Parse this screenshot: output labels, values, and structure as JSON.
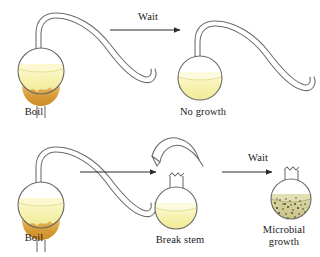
{
  "figure": {
    "colors": {
      "glass_outline": "#6b6a63",
      "broth_light": "#f4f0a8",
      "broth_light_top": "#fbf8d0",
      "broth_contaminated": "#cfc98e",
      "broth_speck": "#3d3a22",
      "flame": "#d79a35",
      "flame_light": "#e8b75c",
      "arrow": "#2b2b2b",
      "text": "#1a1a1a",
      "background": "#ffffff"
    }
  },
  "rows": {
    "top": {
      "start_flask": {
        "label": "Boil",
        "flask_type": "swan-neck",
        "contents": "broth",
        "heated": true
      },
      "transition": {
        "label": "Wait",
        "arrow": "right-arrow"
      },
      "end_flask": {
        "label": "No growth",
        "flask_type": "swan-neck",
        "contents": "clear broth",
        "heated": false
      }
    },
    "bottom": {
      "start_flask": {
        "label": "Boil",
        "flask_type": "swan-neck",
        "contents": "broth",
        "heated": true
      },
      "transition_1": {
        "label": "",
        "arrow": "right-arrow"
      },
      "middle_flask": {
        "label": "Break stem",
        "flask_type": "broken-neck",
        "contents": "clear broth",
        "heated": false,
        "detached_stem": "curved-tube-above"
      },
      "transition_2": {
        "label": "Wait",
        "arrow": "right-arrow"
      },
      "end_flask": {
        "label": "Microbial\ngrowth",
        "flask_type": "broken-neck",
        "contents": "cloudy speckled broth",
        "heated": false
      }
    }
  }
}
